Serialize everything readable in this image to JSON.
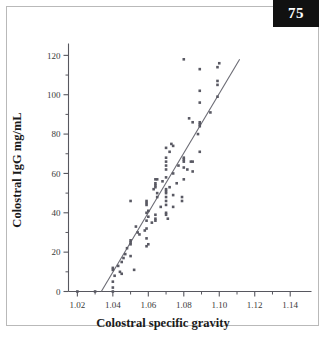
{
  "page": {
    "number_badge": "75"
  },
  "chart_data": {
    "type": "scatter",
    "title": "",
    "xlabel": "Colostral specific gravity",
    "ylabel": "Colostral IgG mg/mL",
    "xlim": [
      1.015,
      1.152
    ],
    "ylim": [
      0,
      124
    ],
    "xticks": [
      1.02,
      1.04,
      1.06,
      1.08,
      1.1,
      1.12,
      1.14
    ],
    "xtick_labels": [
      "1.02",
      "1.04",
      "1.06",
      "1.08",
      "1.10",
      "1.12",
      "1.14"
    ],
    "xminor_step": 0.01,
    "yticks": [
      0,
      20,
      40,
      60,
      80,
      100,
      120
    ],
    "ytick_labels": [
      "0",
      "20",
      "40",
      "60",
      "80",
      "100",
      "120"
    ],
    "yminor_step": 10,
    "grid": false,
    "legend": null,
    "marker": {
      "shape": "square",
      "color": "#595963",
      "size": 2.6
    },
    "trendline": {
      "type": "linear-regression",
      "color": "#6b6b74",
      "x_start": 1.0335,
      "y_start": 0,
      "x_end": 1.1115,
      "y_end": 118
    },
    "points": [
      [
        1.02,
        0
      ],
      [
        1.03,
        0
      ],
      [
        1.04,
        0
      ],
      [
        1.04,
        2
      ],
      [
        1.04,
        5
      ],
      [
        1.04,
        11
      ],
      [
        1.04,
        12
      ],
      [
        1.041,
        8
      ],
      [
        1.043,
        13
      ],
      [
        1.044,
        10
      ],
      [
        1.045,
        9
      ],
      [
        1.045,
        15
      ],
      [
        1.046,
        17
      ],
      [
        1.047,
        19
      ],
      [
        1.048,
        22
      ],
      [
        1.05,
        24
      ],
      [
        1.05,
        25
      ],
      [
        1.05,
        26
      ],
      [
        1.05,
        46
      ],
      [
        1.05,
        18
      ],
      [
        1.052,
        11
      ],
      [
        1.053,
        33
      ],
      [
        1.054,
        30
      ],
      [
        1.055,
        29
      ],
      [
        1.058,
        31
      ],
      [
        1.059,
        23
      ],
      [
        1.059,
        27
      ],
      [
        1.059,
        32
      ],
      [
        1.059,
        36
      ],
      [
        1.059,
        40
      ],
      [
        1.059,
        44
      ],
      [
        1.059,
        45
      ],
      [
        1.059,
        46
      ],
      [
        1.06,
        24
      ],
      [
        1.06,
        38
      ],
      [
        1.06,
        41
      ],
      [
        1.062,
        35
      ],
      [
        1.063,
        52
      ],
      [
        1.064,
        36
      ],
      [
        1.064,
        37
      ],
      [
        1.064,
        39
      ],
      [
        1.064,
        53
      ],
      [
        1.064,
        54
      ],
      [
        1.064,
        55
      ],
      [
        1.064,
        57
      ],
      [
        1.065,
        48
      ],
      [
        1.065,
        50
      ],
      [
        1.065,
        57
      ],
      [
        1.067,
        43
      ],
      [
        1.068,
        56
      ],
      [
        1.07,
        39
      ],
      [
        1.07,
        40
      ],
      [
        1.07,
        44
      ],
      [
        1.07,
        46
      ],
      [
        1.07,
        48
      ],
      [
        1.07,
        50
      ],
      [
        1.07,
        51
      ],
      [
        1.07,
        52
      ],
      [
        1.07,
        58
      ],
      [
        1.07,
        62
      ],
      [
        1.07,
        64
      ],
      [
        1.07,
        66
      ],
      [
        1.07,
        68
      ],
      [
        1.07,
        73
      ],
      [
        1.071,
        37
      ],
      [
        1.072,
        53
      ],
      [
        1.072,
        71
      ],
      [
        1.073,
        75
      ],
      [
        1.074,
        43
      ],
      [
        1.074,
        49
      ],
      [
        1.074,
        60
      ],
      [
        1.074,
        74
      ],
      [
        1.076,
        55
      ],
      [
        1.077,
        64
      ],
      [
        1.079,
        46
      ],
      [
        1.079,
        48
      ],
      [
        1.08,
        57
      ],
      [
        1.08,
        63
      ],
      [
        1.08,
        66
      ],
      [
        1.08,
        67
      ],
      [
        1.08,
        68
      ],
      [
        1.08,
        118
      ],
      [
        1.082,
        62
      ],
      [
        1.083,
        88
      ],
      [
        1.084,
        66
      ],
      [
        1.085,
        61
      ],
      [
        1.085,
        66
      ],
      [
        1.085,
        86
      ],
      [
        1.088,
        80
      ],
      [
        1.089,
        71
      ],
      [
        1.089,
        84
      ],
      [
        1.089,
        85
      ],
      [
        1.089,
        86
      ],
      [
        1.089,
        96
      ],
      [
        1.089,
        102
      ],
      [
        1.089,
        113
      ],
      [
        1.095,
        91
      ],
      [
        1.099,
        99
      ],
      [
        1.099,
        105
      ],
      [
        1.099,
        107
      ],
      [
        1.099,
        114
      ],
      [
        1.1,
        116
      ]
    ]
  }
}
